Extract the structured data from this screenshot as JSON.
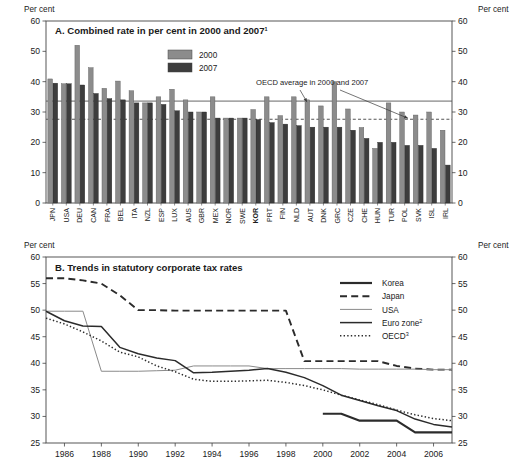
{
  "figure": {
    "axis_unit_label": "Per cent",
    "panel_a_title": "A. Combined rate in per cent in 2000 and 2007",
    "panel_a_title_superscript": "1",
    "panel_b_title": "B. Trends in statutory corporate tax rates",
    "annotation_a": "OECD average in 2000 and 2007"
  },
  "chart_data": [
    {
      "type": "bar",
      "id": "panel-a",
      "title": "A. Combined rate in per cent in 2000 and 2007",
      "xlabel": "",
      "ylabel": "Per cent",
      "ylim": [
        0,
        60
      ],
      "yticks": [
        0,
        10,
        20,
        30,
        40,
        50,
        60
      ],
      "grid": false,
      "legend_position": "top-center",
      "highlight_category": "KOR",
      "categories": [
        "JPN",
        "USA",
        "DEU",
        "CAN",
        "FRA",
        "BEL",
        "ITA",
        "NZL",
        "ESP",
        "LUX",
        "AUS",
        "GBR",
        "MEX",
        "NOR",
        "SWE",
        "KOR",
        "PRT",
        "FIN",
        "NLD",
        "AUT",
        "DNK",
        "GRC",
        "CZE",
        "CHE",
        "HUN",
        "TUR",
        "POL",
        "SVK",
        "ISL",
        "IRL"
      ],
      "series": [
        {
          "name": "2000",
          "color": "#8c8c8c",
          "values": [
            40.9,
            39.3,
            52.0,
            44.6,
            37.8,
            40.2,
            37.0,
            33.0,
            35.0,
            37.5,
            34.0,
            30.0,
            35.0,
            28.0,
            28.0,
            30.8,
            35.0,
            28.8,
            35.0,
            34.0,
            32.0,
            40.0,
            31.0,
            24.9,
            18.0,
            33.0,
            30.0,
            29.0,
            30.0,
            24.0
          ]
        },
        {
          "name": "2007",
          "color": "#3d3d3d",
          "values": [
            39.5,
            39.3,
            38.9,
            36.1,
            34.4,
            34.0,
            33.0,
            33.0,
            32.5,
            30.4,
            30.0,
            30.0,
            28.0,
            28.0,
            28.0,
            27.5,
            26.5,
            26.0,
            25.5,
            25.0,
            25.0,
            25.0,
            24.0,
            21.3,
            20.0,
            20.0,
            19.0,
            19.0,
            18.0,
            12.5
          ]
        }
      ],
      "reference_lines": [
        {
          "name": "OECD average 2000",
          "value": 33.6,
          "style": "solid"
        },
        {
          "name": "OECD average 2007",
          "value": 27.6,
          "style": "dotted"
        }
      ],
      "annotation": "OECD average in 2000 and 2007"
    },
    {
      "type": "line",
      "id": "panel-b",
      "title": "B. Trends in statutory corporate tax rates",
      "xlabel": "",
      "ylabel": "Per cent",
      "ylim": [
        25,
        60
      ],
      "yticks": [
        25,
        30,
        35,
        40,
        45,
        50,
        55,
        60
      ],
      "xlim": [
        1985,
        2007
      ],
      "xticks": [
        1986,
        1988,
        1990,
        1992,
        1994,
        1996,
        1998,
        2000,
        2002,
        2004,
        2006
      ],
      "grid": false,
      "legend_position": "right",
      "x": [
        1985,
        1986,
        1987,
        1988,
        1989,
        1990,
        1991,
        1992,
        1993,
        1994,
        1995,
        1996,
        1997,
        1998,
        1999,
        2000,
        2001,
        2002,
        2003,
        2004,
        2005,
        2006,
        2007
      ],
      "series": [
        {
          "name": "Korea",
          "style": "solid-thick",
          "color": "#2b2b2b",
          "values": [
            null,
            null,
            null,
            null,
            null,
            null,
            null,
            null,
            null,
            null,
            null,
            null,
            null,
            null,
            null,
            30.5,
            30.5,
            29.2,
            29.2,
            29.2,
            27.0,
            27.0,
            27.0
          ]
        },
        {
          "name": "Japan",
          "style": "dashed",
          "color": "#2b2b2b",
          "values": [
            56.0,
            56.0,
            55.6,
            55.0,
            52.8,
            50.0,
            50.0,
            49.9,
            49.9,
            49.9,
            49.9,
            49.9,
            49.9,
            49.9,
            40.4,
            40.4,
            40.4,
            40.4,
            40.4,
            39.5,
            39.0,
            38.8,
            38.8
          ]
        },
        {
          "name": "USA",
          "style": "solid-thin",
          "color": "#8a8a8a",
          "values": [
            49.8,
            49.8,
            49.8,
            38.5,
            38.5,
            38.5,
            38.6,
            38.7,
            39.5,
            39.5,
            39.5,
            39.5,
            39.0,
            39.0,
            39.0,
            39.0,
            39.0,
            38.9,
            38.9,
            38.9,
            38.9,
            38.8,
            38.8
          ]
        },
        {
          "name": "Euro zone",
          "superscript": "2",
          "style": "solid-med",
          "color": "#2b2b2b",
          "values": [
            49.8,
            48.0,
            47.0,
            46.9,
            43.0,
            41.8,
            41.0,
            40.5,
            38.2,
            38.3,
            38.5,
            38.7,
            39.0,
            38.3,
            37.3,
            35.8,
            34.0,
            33.0,
            32.0,
            31.1,
            29.5,
            28.5,
            28.0
          ]
        },
        {
          "name": "OECD",
          "superscript": "3",
          "style": "dotted",
          "color": "#2b2b2b",
          "values": [
            48.5,
            47.4,
            45.9,
            44.2,
            42.1,
            41.2,
            39.5,
            38.4,
            37.0,
            36.6,
            36.6,
            36.7,
            36.8,
            36.4,
            35.8,
            35.0,
            34.0,
            33.1,
            32.2,
            31.2,
            30.3,
            29.6,
            29.2
          ]
        }
      ]
    }
  ],
  "panel_a_legend": [
    {
      "label": "2000",
      "color": "#8c8c8c"
    },
    {
      "label": "2007",
      "color": "#3d3d3d"
    }
  ],
  "panel_b_legend": [
    {
      "label": "Korea",
      "sup": ""
    },
    {
      "label": "Japan",
      "sup": ""
    },
    {
      "label": "USA",
      "sup": ""
    },
    {
      "label": "Euro zone",
      "sup": "2"
    },
    {
      "label": "OECD",
      "sup": "3"
    }
  ]
}
